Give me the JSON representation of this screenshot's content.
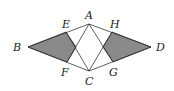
{
  "figure": {
    "type": "geometry-diagram",
    "labels": {
      "A": "A",
      "B": "B",
      "C": "C",
      "D": "D",
      "E": "E",
      "F": "F",
      "G": "G",
      "H": "H"
    },
    "points": {
      "A": [
        89,
        24
      ],
      "B": [
        28,
        47
      ],
      "C": [
        89,
        71
      ],
      "D": [
        151,
        47
      ],
      "E": [
        66,
        32
      ],
      "F": [
        67,
        62
      ],
      "G": [
        113,
        62
      ],
      "H": [
        112,
        32
      ]
    },
    "shaded_regions": [
      [
        "B",
        "E",
        "X1",
        "F"
      ],
      [
        "D",
        "H",
        "X2",
        "G"
      ]
    ],
    "colors": {
      "shade": "#8a8a8a",
      "stroke": "#333333"
    }
  }
}
